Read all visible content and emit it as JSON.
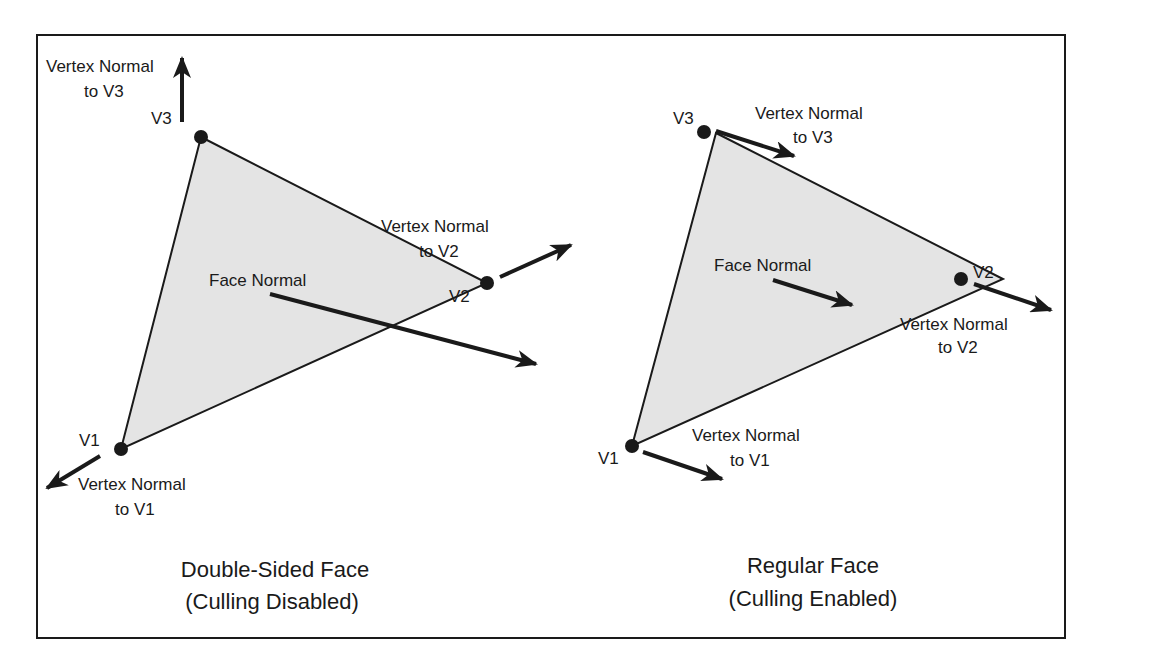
{
  "colors": {
    "border": "#1a1a1a",
    "face_fill": "#e4e4e4",
    "stroke": "#1a1a1a",
    "background": "#ffffff"
  },
  "panels": [
    {
      "id": "double-sided",
      "caption_line1": "Double-Sided Face",
      "caption_line2": "(Culling Disabled)",
      "vertices": {
        "v1": {
          "label": "V1",
          "x": 121,
          "y": 449
        },
        "v2": {
          "label": "V2",
          "x": 487,
          "y": 283
        },
        "v3": {
          "label": "V3",
          "x": 201,
          "y": 137
        }
      },
      "labels": {
        "vn3_line1": "Vertex Normal",
        "vn3_line2": "to V3",
        "vn2_line1": "Vertex Normal",
        "vn2_line2": "to V2",
        "vn1_line1": "Vertex Normal",
        "vn1_line2": "to V1",
        "face_normal": "Face Normal"
      }
    },
    {
      "id": "regular",
      "caption_line1": "Regular Face",
      "caption_line2": "(Culling Enabled)",
      "vertices": {
        "v1": {
          "label": "V1",
          "x": 632,
          "y": 446
        },
        "v2": {
          "label": "V2",
          "x": 1003,
          "y": 279
        },
        "v3": {
          "label": "V3",
          "x": 716,
          "y": 133
        }
      },
      "labels": {
        "vn3_line1": "Vertex Normal",
        "vn3_line2": "to V3",
        "vn2_line1": "Vertex Normal",
        "vn2_line2": "to V2",
        "vn1_line1": "Vertex Normal",
        "vn1_line2": "to V1",
        "face_normal": "Face Normal"
      }
    }
  ]
}
